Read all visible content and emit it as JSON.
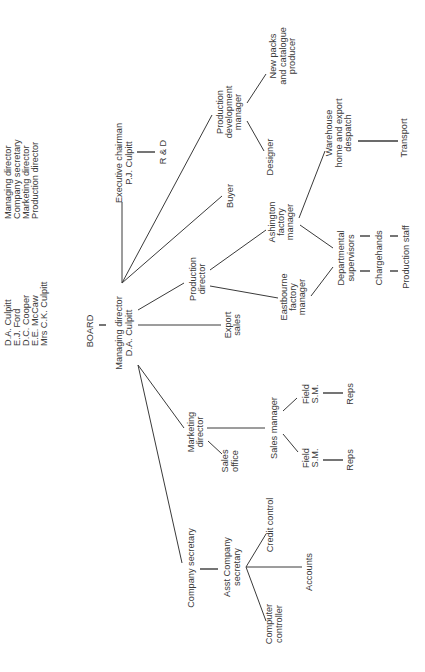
{
  "board_list": {
    "members": [
      {
        "name": "D.A. Culpitt",
        "role": "Managing director"
      },
      {
        "name": "E.J. Ford",
        "role": "Company secretary"
      },
      {
        "name": "D.C. Cooper",
        "role": "Marketing director"
      },
      {
        "name": "E.E. McCaw",
        "role": "Production director"
      },
      {
        "name": "Mrs C.K. Culpitt",
        "role": ""
      }
    ]
  },
  "nodes": {
    "board": "BOARD",
    "managing_director": {
      "line1": "Managing director",
      "line2": "D.A. Culpitt"
    },
    "executive_chairman": {
      "line1": "Executive chairman",
      "line2": "P.J. Culpitt"
    },
    "r_and_d": "R & D",
    "buyer": "Buyer",
    "production_director": {
      "line1": "Production",
      "line2": "director"
    },
    "export_sales": {
      "line1": "Export",
      "line2": "sales"
    },
    "production_development_manager": {
      "line1": "Production",
      "line2": "development",
      "line3": "manager"
    },
    "new_packs": {
      "line1": "New packs",
      "line2": "and catalogue",
      "line3": "producer"
    },
    "designer": "Designer",
    "ashington": {
      "line1": "Ashington",
      "line2": "factory",
      "line3": "manager"
    },
    "eastbourne": {
      "line1": "Eastbourne",
      "line2": "factory",
      "line3": "manager"
    },
    "warehouse": {
      "line1": "Warehouse",
      "line2": "home and export",
      "line3": "despatch"
    },
    "transport": "Transport",
    "departmental_supervisors": {
      "line1": "Departmental",
      "line2": "supervisors"
    },
    "chargehands": "Chargehands",
    "production_staff": "Production staff",
    "marketing_director": {
      "line1": "Marketing",
      "line2": "director"
    },
    "sales_office": {
      "line1": "Sales",
      "line2": "office"
    },
    "sales_manager": "Sales manager",
    "field_sm_1": {
      "line1": "Field",
      "line2": "S.M."
    },
    "reps_1": "Reps",
    "field_sm_2": {
      "line1": "Field",
      "line2": "S.M."
    },
    "reps_2": "Reps",
    "company_secretary": "Company secretary",
    "asst_company_secretary": {
      "line1": "Asst Company",
      "line2": "secretary"
    },
    "credit_control": "Credit control",
    "accounts": "Accounts",
    "computer_controller": {
      "line1": "Computer",
      "line2": "controller"
    }
  }
}
